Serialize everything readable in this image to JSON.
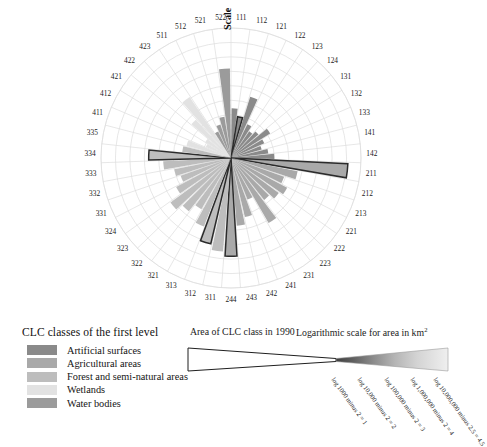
{
  "chart_data": {
    "type": "bar",
    "chart_variant": "polar-rose",
    "title": "",
    "xlabel": "",
    "ylabel": "",
    "radial_axis_label": "Scale",
    "radial_scale": "logarithmic",
    "rlim": [
      0,
      4.5
    ],
    "grid": true,
    "legend_position": "bottom-left",
    "units": "log10(area in km2) minus 2",
    "categories": [
      "111",
      "112",
      "121",
      "122",
      "123",
      "124",
      "131",
      "132",
      "133",
      "141",
      "142",
      "211",
      "212",
      "213",
      "221",
      "222",
      "223",
      "231",
      "241",
      "242",
      "243",
      "244",
      "311",
      "312",
      "313",
      "321",
      "322",
      "323",
      "324",
      "331",
      "332",
      "333",
      "334",
      "335",
      "411",
      "412",
      "421",
      "422",
      "423",
      "511",
      "512",
      "521",
      "522"
    ],
    "values": [
      1.72,
      1.45,
      2.22,
      1.3,
      1.12,
      1.25,
      1.6,
      1.26,
      1.1,
      1.3,
      1.5,
      4.05,
      2.35,
      1.95,
      2.2,
      2.05,
      1.85,
      2.6,
      1.55,
      2.1,
      2.35,
      3.4,
      3.25,
      3.05,
      2.55,
      2.05,
      2.35,
      2.6,
      2.15,
      1.85,
      2.0,
      2.35,
      2.85,
      1.7,
      1.6,
      0.95,
      1.05,
      1.8,
      2.55,
      1.02,
      1.22,
      1.45,
      3.1
    ],
    "series": [
      {
        "name": "Artificial surfaces",
        "codes": [
          "111",
          "112",
          "121",
          "122",
          "123",
          "124",
          "131",
          "132",
          "133",
          "141",
          "142"
        ]
      },
      {
        "name": "Agricultural areas",
        "codes": [
          "211",
          "212",
          "213",
          "221",
          "222",
          "223",
          "231",
          "241",
          "242",
          "243",
          "244"
        ]
      },
      {
        "name": "Forest and semi-natural areas",
        "codes": [
          "311",
          "312",
          "313",
          "321",
          "322",
          "323",
          "324",
          "331",
          "332",
          "333",
          "334",
          "335"
        ]
      },
      {
        "name": "Wetlands",
        "codes": [
          "411",
          "412",
          "421",
          "422",
          "423"
        ]
      },
      {
        "name": "Water bodies",
        "codes": [
          "511",
          "512",
          "521",
          "522"
        ]
      }
    ],
    "highlighted_sectors": [
      "244",
      "334",
      "112",
      "312",
      "211"
    ],
    "annotations": []
  },
  "rose": {
    "scale_axis_label": "Scale",
    "sector_labels": [
      "111",
      "112",
      "121",
      "122",
      "123",
      "124",
      "131",
      "132",
      "133",
      "141",
      "142",
      "211",
      "212",
      "213",
      "221",
      "222",
      "223",
      "231",
      "241",
      "242",
      "243",
      "244",
      "311",
      "312",
      "313",
      "321",
      "322",
      "323",
      "324",
      "331",
      "332",
      "333",
      "334",
      "335",
      "411",
      "412",
      "421",
      "422",
      "423",
      "511",
      "512",
      "521",
      "522"
    ]
  },
  "legend": {
    "title": "CLC classes of the first level",
    "items": [
      {
        "label": "Artificial surfaces",
        "color": "#8a8a8a"
      },
      {
        "label": "Agricultural areas",
        "color": "#a9a9a9"
      },
      {
        "label": "Forest and semi-natural areas",
        "color": "#bdbdbd"
      },
      {
        "label": "Wetlands",
        "color": "#e2e2e2"
      },
      {
        "label": "Water bodies",
        "color": "#9b9b9b"
      }
    ]
  },
  "scalebar": {
    "heading_left": "Area of CLC class in 1990",
    "heading_right": "Logarithmic scale for area in km",
    "heading_right_sup": "2",
    "ticks": [
      {
        "caption": "log 1000 minus 2 = 1",
        "value": 1
      },
      {
        "caption": "log 10,000 minus 2 = 2",
        "value": 2
      },
      {
        "caption": "log 100,000 minus 2 = 3",
        "value": 3
      },
      {
        "caption": "log 1,000,000 minus 2 = 4",
        "value": 4
      },
      {
        "caption": "log 10,000,000 minus 2.5 = 4.5",
        "value": 4.5
      }
    ],
    "gradient_steps": [
      "#4d4d4d",
      "#6f6f6f",
      "#9a9a9a",
      "#b8b8b8",
      "#d6d6d6",
      "#ededed"
    ]
  },
  "colors": {
    "artificial": "#8a8a8a",
    "agricultural": "#a9a9a9",
    "forest": "#bdbdbd",
    "wetlands": "#e2e2e2",
    "water": "#9b9b9b",
    "grid": "#dcdcdc",
    "outline": "#2b2b2b"
  }
}
